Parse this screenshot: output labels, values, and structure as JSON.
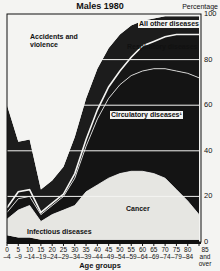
{
  "title": "Males 1980",
  "y_axis_title": "Percentage",
  "x_axis_title": "Age groups",
  "y_ticks": [
    "100",
    "80",
    "60",
    "40",
    "20",
    "0"
  ],
  "x_ticks": [
    {
      "top": "0",
      "bottom": "–4"
    },
    {
      "top": "5",
      "bottom": "–9"
    },
    {
      "top": "10",
      "bottom": "–14"
    },
    {
      "top": "15",
      "bottom": "–19"
    },
    {
      "top": "20",
      "bottom": "–24"
    },
    {
      "top": "25",
      "bottom": "–29"
    },
    {
      "top": "30",
      "bottom": "–34"
    },
    {
      "top": "35",
      "bottom": "–39"
    },
    {
      "top": "40",
      "bottom": "–44"
    },
    {
      "top": "45",
      "bottom": "–49"
    },
    {
      "top": "50",
      "bottom": "–54"
    },
    {
      "top": "55",
      "bottom": "–59"
    },
    {
      "top": "60",
      "bottom": "–64"
    },
    {
      "top": "65",
      "bottom": "–69"
    },
    {
      "top": "70",
      "bottom": "–74"
    },
    {
      "top": "75",
      "bottom": "–79"
    },
    {
      "top": "80",
      "bottom": "–84"
    },
    {
      "top": "85 and",
      "bottom": "over"
    }
  ],
  "labels": {
    "accidents": "Accidents and violence",
    "all_other": "All other diseases",
    "respiratory": "Respiratory diseases",
    "circulatory": "Circulatory diseases¹",
    "cancer": "Cancer",
    "infectious": "Infectious diseases"
  },
  "chart_data": {
    "type": "area",
    "stacked": true,
    "title": "Males 1980",
    "xlabel": "Age groups",
    "ylabel": "Percentage",
    "ylim": [
      0,
      100
    ],
    "grid": true,
    "categories": [
      "0-4",
      "5-9",
      "10-14",
      "15-19",
      "20-24",
      "25-29",
      "30-34",
      "35-39",
      "40-44",
      "45-49",
      "50-54",
      "55-59",
      "60-64",
      "65-69",
      "70-74",
      "75-79",
      "80-84",
      "85 and over"
    ],
    "series": [
      {
        "name": "Infectious diseases",
        "values": [
          3,
          2,
          2,
          1,
          1,
          1,
          1,
          1,
          1,
          1,
          1,
          1,
          1,
          1,
          1,
          1,
          1,
          1
        ]
      },
      {
        "name": "Cancer",
        "values": [
          7,
          12,
          14,
          8,
          11,
          13,
          15,
          21,
          24,
          27,
          29,
          30,
          30,
          29,
          27,
          22,
          17,
          11
        ]
      },
      {
        "name": "Circulatory diseases",
        "values": [
          3,
          5,
          4,
          3,
          4,
          6,
          12,
          20,
          29,
          35,
          39,
          42,
          44,
          46,
          48,
          52,
          56,
          60
        ]
      },
      {
        "name": "Respiratory diseases",
        "values": [
          2,
          3,
          3,
          1,
          1,
          1,
          2,
          3,
          4,
          5,
          6,
          8,
          11,
          12,
          14,
          16,
          17,
          19
        ]
      },
      {
        "name": "All other diseases",
        "values": [
          45,
          22,
          22,
          10,
          10,
          12,
          16,
          18,
          18,
          17,
          16,
          14,
          11,
          10,
          9,
          8,
          8,
          8
        ]
      },
      {
        "name": "Accidents and violence",
        "values": [
          40,
          56,
          55,
          77,
          73,
          67,
          54,
          37,
          24,
          15,
          9,
          5,
          3,
          2,
          1,
          1,
          1,
          1
        ]
      }
    ]
  }
}
